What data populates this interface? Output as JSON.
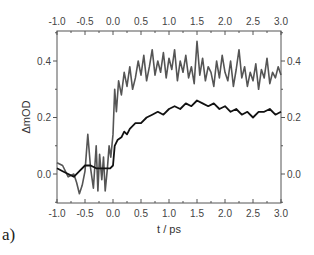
{
  "chart_data": {
    "type": "line",
    "title": "",
    "panel_label": "a)",
    "xlabel": "t / ps",
    "ylabel": "ΔmOD",
    "xlim": [
      -1.0,
      3.0
    ],
    "ylim": [
      -0.1,
      0.5
    ],
    "xticks": [
      "-1.0",
      "-0.5",
      "0.0",
      "0.5",
      "1.0",
      "1.5",
      "2.0",
      "2.5",
      "3.0"
    ],
    "yticks": [
      "0.0",
      "0.2",
      "0.4"
    ],
    "top_axis_ticks": [
      "-1.0",
      "-0.5",
      "0.0",
      "0.5",
      "1.0",
      "1.5",
      "2.0",
      "2.5",
      "3.0"
    ],
    "right_axis_ticks": [
      "0.0",
      "0.2",
      "0.4"
    ],
    "grid": false,
    "legend": null,
    "series": [
      {
        "name": "grey trace (noisy)",
        "color": "#555555",
        "x": [
          -1.0,
          -0.9,
          -0.8,
          -0.7,
          -0.65,
          -0.6,
          -0.55,
          -0.5,
          -0.45,
          -0.4,
          -0.35,
          -0.3,
          -0.27,
          -0.24,
          -0.2,
          -0.17,
          -0.14,
          -0.1,
          -0.07,
          -0.04,
          0.0,
          0.03,
          0.06,
          0.1,
          0.15,
          0.2,
          0.25,
          0.3,
          0.35,
          0.4,
          0.45,
          0.5,
          0.55,
          0.6,
          0.65,
          0.7,
          0.75,
          0.8,
          0.85,
          0.9,
          0.95,
          1.0,
          1.05,
          1.1,
          1.15,
          1.2,
          1.25,
          1.3,
          1.35,
          1.4,
          1.45,
          1.5,
          1.55,
          1.6,
          1.65,
          1.7,
          1.75,
          1.8,
          1.85,
          1.9,
          1.95,
          2.0,
          2.05,
          2.1,
          2.15,
          2.2,
          2.25,
          2.3,
          2.35,
          2.4,
          2.45,
          2.5,
          2.55,
          2.6,
          2.65,
          2.7,
          2.75,
          2.8,
          2.85,
          2.9,
          2.95,
          3.0
        ],
        "y": [
          0.04,
          0.03,
          -0.01,
          0.0,
          -0.03,
          -0.07,
          -0.04,
          0.01,
          0.14,
          0.02,
          -0.05,
          0.1,
          -0.06,
          0.07,
          -0.02,
          0.06,
          -0.06,
          0.02,
          0.1,
          0.06,
          0.14,
          0.3,
          0.22,
          0.33,
          0.28,
          0.36,
          0.31,
          0.38,
          0.3,
          0.34,
          0.4,
          0.35,
          0.42,
          0.33,
          0.38,
          0.44,
          0.35,
          0.4,
          0.36,
          0.43,
          0.34,
          0.41,
          0.37,
          0.44,
          0.33,
          0.4,
          0.36,
          0.42,
          0.34,
          0.38,
          0.32,
          0.47,
          0.35,
          0.41,
          0.33,
          0.38,
          0.36,
          0.31,
          0.4,
          0.34,
          0.42,
          0.36,
          0.33,
          0.4,
          0.31,
          0.37,
          0.44,
          0.34,
          0.38,
          0.31,
          0.36,
          0.33,
          0.39,
          0.3,
          0.37,
          0.34,
          0.41,
          0.32,
          0.36,
          0.34,
          0.38,
          0.35
        ]
      },
      {
        "name": "black trace",
        "color": "#111111",
        "x": [
          -1.0,
          -0.9,
          -0.8,
          -0.7,
          -0.6,
          -0.5,
          -0.4,
          -0.3,
          -0.2,
          -0.1,
          -0.05,
          0.0,
          0.03,
          0.08,
          0.15,
          0.2,
          0.25,
          0.3,
          0.4,
          0.5,
          0.6,
          0.7,
          0.8,
          0.9,
          1.0,
          1.1,
          1.2,
          1.3,
          1.4,
          1.5,
          1.6,
          1.7,
          1.8,
          1.9,
          2.0,
          2.1,
          2.2,
          2.3,
          2.4,
          2.5,
          2.6,
          2.7,
          2.8,
          2.9,
          3.0
        ],
        "y": [
          0.02,
          0.01,
          0.0,
          -0.01,
          0.01,
          0.03,
          0.03,
          0.02,
          0.02,
          0.02,
          0.02,
          0.03,
          0.1,
          0.12,
          0.13,
          0.15,
          0.14,
          0.16,
          0.18,
          0.18,
          0.2,
          0.21,
          0.22,
          0.21,
          0.23,
          0.24,
          0.23,
          0.25,
          0.24,
          0.26,
          0.25,
          0.24,
          0.25,
          0.23,
          0.24,
          0.22,
          0.23,
          0.21,
          0.22,
          0.2,
          0.22,
          0.22,
          0.23,
          0.21,
          0.22
        ]
      }
    ]
  }
}
